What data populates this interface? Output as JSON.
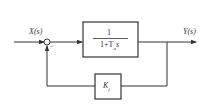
{
  "diagram": {
    "type": "block-diagram",
    "input_label": "X(s)",
    "output_label": "Y(s)",
    "summing_junction": {
      "sign_feedback": "−"
    },
    "forward_block": {
      "numerator": "1",
      "denominator": "1+T",
      "denominator_sub": "a",
      "denominator_var": "s"
    },
    "feedback_block": {
      "gain": "K",
      "gain_sub": "f"
    }
  }
}
